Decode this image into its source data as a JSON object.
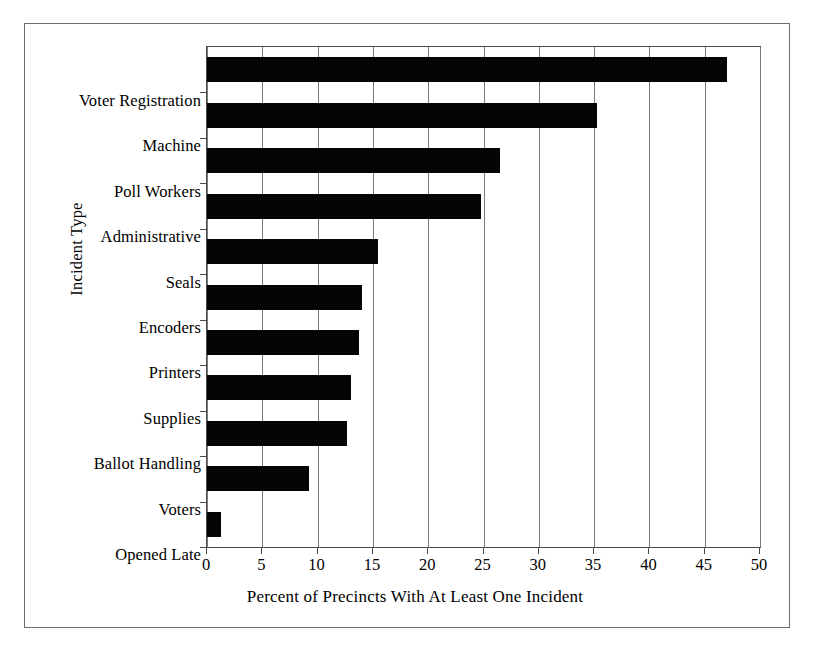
{
  "chart_data": {
    "type": "bar",
    "orientation": "horizontal",
    "title": "",
    "xlabel": "Percent of Precincts With At Least One Incident",
    "ylabel": "Incident Type",
    "xlim": [
      0,
      50
    ],
    "xticks": [
      0,
      5,
      10,
      15,
      20,
      25,
      30,
      35,
      40,
      45,
      50
    ],
    "xtick_labels": [
      "0",
      "5",
      "10",
      "15",
      "20",
      "25",
      "30",
      "35",
      "40",
      "45",
      "50"
    ],
    "grid": "vertical",
    "legend": "none",
    "bar_color": "#050505",
    "categories": [
      "Voter Registration",
      "Machine",
      "Poll Workers",
      "Administrative",
      "Seals",
      "Encoders",
      "Printers",
      "Supplies",
      "Ballot Handling",
      "Voters",
      "Opened Late"
    ],
    "values": [
      47.0,
      35.3,
      26.5,
      24.8,
      15.5,
      14.0,
      13.7,
      13.0,
      12.7,
      9.2,
      1.3
    ]
  }
}
